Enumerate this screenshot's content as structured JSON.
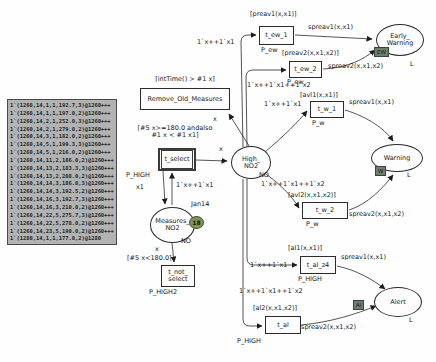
{
  "figure": {
    "kind": "coloured-petri-net-model"
  },
  "token_box": {
    "lines": [
      "1`(1260,14,1,1,192.7,3)@1260+++",
      "1`(1260,14,1,1,197.0,2)@1260+++",
      "1`(1260,14,2,1,252.0,3)@1260+++",
      "1`(1260,14,2,1,279.0,2)@1260+++",
      "1`(1260,14,3,1,182.0,2)@1260+++",
      "1`(1260,14,5,1,199.3,3)@1260+++",
      "1`(1260,14,5,1,216.0,2)@1260+++",
      "1`(1260,14,11,2,186.0,2)@1260+++",
      "1`(1260,14,13,2,183.3,3)@1260+++",
      "1`(1260,14,13,2,208.0,2)@1260+++",
      "1`(1260,14,14,3,186.0,3)@1260+++",
      "1`(1260,14,14,3,192.5,2)@1260+++",
      "1`(1260,14,16,3,192.7,3)@1260+++",
      "1`(1260,14,16,3,210.0,2)@1260+++",
      "1`(1260,14,22,5,275.7,3)@1260+++",
      "1`(1260,14,22,5,278.0,2)@1260+++",
      "1`(1260,14,23,5,190.0,2)@1260+++",
      "1`(1280,14,1,1,177.0,2)@1280"
    ]
  },
  "places": {
    "high_no2": {
      "name": "High_\nNO2",
      "colorset": "NO"
    },
    "measures_no2": {
      "name": "Measures_\nNO2",
      "colorset": "NO",
      "marking_count": "18",
      "clock_label": "Jan14"
    },
    "early_warning": {
      "name": "Early_\nWarning",
      "colorset": "L",
      "fusion_tag": "EW"
    },
    "warning": {
      "name": "Warning",
      "colorset": "L",
      "fusion_tag": "W"
    },
    "alert": {
      "name": "Alert",
      "colorset": "L",
      "fusion_tag": "Al"
    }
  },
  "transitions": {
    "remove_old_measures": {
      "name": "Remove_Old_Measures",
      "guard": "[intTime() > #1 x]"
    },
    "t_select": {
      "name": "t_select",
      "guard": "[#5 x>=180.0 andalso\n#1 x < #1 x1]",
      "page_tag": "P_HIGH"
    },
    "t_not_select": {
      "name": "t_not_\nselect",
      "guard": "[#5 x<180.0]",
      "page_tag": "P_HIGH2"
    },
    "t_ew_1": {
      "name": "t_ew_1",
      "guard": "[preav1(x,x1)]",
      "page_tag": "P_ew"
    },
    "t_ew_2": {
      "name": "t_ew_2",
      "guard": "[preav2(x,x1,x2)]",
      "page_tag": "P_ew"
    },
    "t_w_1": {
      "name": "t_w_1",
      "guard": "[avl1(x,x1)]",
      "page_tag": "P_w"
    },
    "t_w_2": {
      "name": "t_w_2",
      "guard": "[avl2(x,x1,x2)]",
      "page_tag": "P_w"
    },
    "t_al_z4": {
      "name": "t_al_z4",
      "guard": "[al1(x,x1)]",
      "page_tag": "P_HIGH"
    },
    "t_al": {
      "name": "t_al",
      "guard": "[al2(x,x1,x2)]",
      "page_tag": "P_HIGH"
    }
  },
  "arc_labels": {
    "measures_to_remove": "x",
    "select_to_high": "x",
    "select_to_measures": "x1",
    "measures_to_select": "1`x++1`x1",
    "measures_to_not_select": "x",
    "high_to_t_ew_1": "1`x++1`x1",
    "high_to_t_ew_2": "1`x++1`x1++1`x2",
    "high_to_t_w_1": "1`x++1`x1",
    "high_to_t_w_2": "1`x++1`x1++1`x2",
    "high_to_t_al_z4": "1`x++1`x1",
    "high_to_t_al": "1`x++1`x1++1`x2",
    "t_ew_1_to_early_warning": "spreav1(x,x1)",
    "t_ew_2_to_early_warning": "spreav2(x,x1,x2)",
    "t_w_1_to_warning": "spreav1(x,x1)",
    "t_w_2_to_warning": "spreav2(x,x1,x2)",
    "t_al_z4_to_alert": "spreav1(x,x1)",
    "t_al_to_alert": "spreav2(x,x1,x2)"
  },
  "colors": {
    "line": "#222222",
    "marking_badge": "#7f9455",
    "fusion_tag": "#6e7e6e",
    "token_box_bg": "#b3b3b3"
  }
}
